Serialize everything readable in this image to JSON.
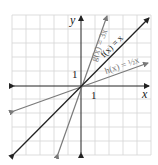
{
  "figure": {
    "type": "coordinate-graph",
    "axes": {
      "x_label": "x",
      "y_label": "y",
      "x_tick_label": "1",
      "y_tick_label": "1"
    },
    "grid": {
      "cells_x": 10,
      "cells_y": 10,
      "origin_cell": [
        5,
        5
      ],
      "color": "#d0d0d0"
    },
    "functions": [
      {
        "name": "g",
        "label": "g(x) = 3x",
        "slope": 3,
        "color": "#7a7a7a"
      },
      {
        "name": "f",
        "label": "f(x) = x",
        "slope": 1,
        "color": "#222222"
      },
      {
        "name": "h",
        "label": "h(x) = ½x",
        "slope": 0.5,
        "color": "#7a7a7a"
      }
    ]
  }
}
